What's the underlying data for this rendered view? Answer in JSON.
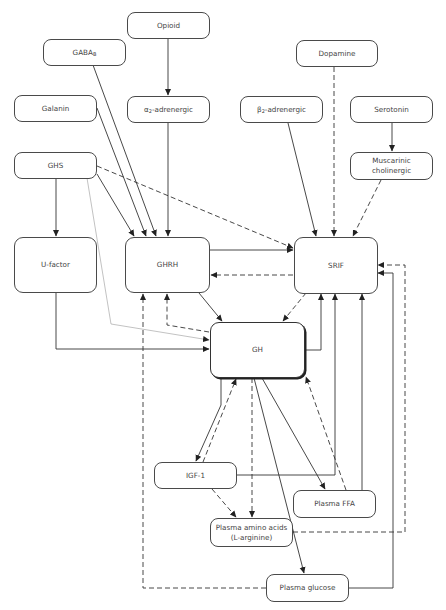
{
  "diagram": {
    "type": "regulatory-network",
    "nodes": {
      "opioid": {
        "label": "Opioid"
      },
      "gaba_b": {
        "label": "GABA",
        "sub": "B"
      },
      "alpha2": {
        "label_prefix": "α",
        "sub": "2",
        "label": "-adrenergic"
      },
      "galanin": {
        "label": "Galanin"
      },
      "dopamine": {
        "label": "Dopamine"
      },
      "beta2": {
        "label_prefix": "β",
        "sub": "2",
        "label": "-adrenergic"
      },
      "serotonin": {
        "label": "Serotonin"
      },
      "muscarinic": {
        "line1": "Muscarinic",
        "line2": "cholinergic"
      },
      "ghs": {
        "label": "GHS"
      },
      "ufactor": {
        "label": "U-factor"
      },
      "ghrh": {
        "label": "GHRH"
      },
      "srif": {
        "label": "SRIF"
      },
      "gh": {
        "label": "GH"
      },
      "igf1": {
        "label": "IGF-1"
      },
      "ffa": {
        "label": "Plasma FFA"
      },
      "amino": {
        "line1": "Plasma amino acids",
        "line2": "(L-arginine)"
      },
      "glucose": {
        "label": "Plasma glucose"
      }
    },
    "edges": [
      {
        "from": "Opioid",
        "to": "α2-adrenergic",
        "style": "solid"
      },
      {
        "from": "GABA-B",
        "to": "GHRH",
        "style": "solid"
      },
      {
        "from": "Galanin",
        "to": "GHRH",
        "style": "solid"
      },
      {
        "from": "α2-adrenergic",
        "to": "GHRH",
        "style": "solid"
      },
      {
        "from": "GHS",
        "to": "GHRH",
        "style": "solid"
      },
      {
        "from": "GHS",
        "to": "U-factor",
        "style": "solid"
      },
      {
        "from": "GHS",
        "to": "SRIF",
        "style": "dashed"
      },
      {
        "from": "GHS",
        "to": "GH",
        "style": "thin"
      },
      {
        "from": "Dopamine",
        "to": "SRIF",
        "style": "dashed"
      },
      {
        "from": "β2-adrenergic",
        "to": "SRIF",
        "style": "solid"
      },
      {
        "from": "Serotonin",
        "to": "Muscarinic cholinergic",
        "style": "solid"
      },
      {
        "from": "Muscarinic cholinergic",
        "to": "SRIF",
        "style": "dashed"
      },
      {
        "from": "GHRH",
        "to": "SRIF",
        "style": "solid"
      },
      {
        "from": "SRIF",
        "to": "GHRH",
        "style": "dashed"
      },
      {
        "from": "GHRH",
        "to": "GH",
        "style": "solid"
      },
      {
        "from": "SRIF",
        "to": "GH",
        "style": "dashed"
      },
      {
        "from": "GH",
        "to": "GHRH",
        "style": "dashed"
      },
      {
        "from": "GH",
        "to": "SRIF",
        "style": "solid"
      },
      {
        "from": "U-factor",
        "to": "GH",
        "style": "solid"
      },
      {
        "from": "GH",
        "to": "IGF-1",
        "style": "solid"
      },
      {
        "from": "IGF-1",
        "to": "GH",
        "style": "dashed"
      },
      {
        "from": "IGF-1",
        "to": "SRIF",
        "style": "solid"
      },
      {
        "from": "IGF-1",
        "to": "Plasma amino acids",
        "style": "dashed"
      },
      {
        "from": "GH",
        "to": "Plasma amino acids",
        "style": "dashed"
      },
      {
        "from": "GH",
        "to": "Plasma FFA",
        "style": "solid"
      },
      {
        "from": "Plasma FFA",
        "to": "GH",
        "style": "dashed"
      },
      {
        "from": "Plasma FFA",
        "to": "SRIF",
        "style": "solid"
      },
      {
        "from": "GH",
        "to": "Plasma glucose",
        "style": "solid"
      },
      {
        "from": "Plasma glucose",
        "to": "SRIF",
        "style": "solid"
      },
      {
        "from": "Plasma glucose",
        "to": "GHRH",
        "style": "dashed"
      },
      {
        "from": "Plasma amino acids",
        "to": "SRIF",
        "style": "dashed"
      }
    ]
  }
}
